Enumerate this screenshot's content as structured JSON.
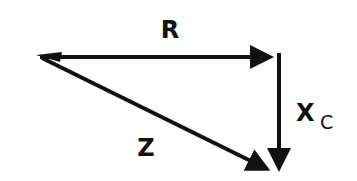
{
  "diagram": {
    "type": "impedance-triangle",
    "labels": {
      "resistance": "R",
      "reactance_main": "X",
      "reactance_sub": "C",
      "impedance": "Z"
    },
    "vectors": [
      {
        "name": "R",
        "from": "origin",
        "to": "right-corner",
        "direction": "right"
      },
      {
        "name": "Xc",
        "from": "right-corner",
        "to": "bottom-corner",
        "direction": "down"
      },
      {
        "name": "Z",
        "from": "origin",
        "to": "bottom-corner",
        "direction": "diagonal-down-right"
      }
    ],
    "colors": {
      "stroke": "#111111",
      "background": "#ffffff"
    }
  }
}
